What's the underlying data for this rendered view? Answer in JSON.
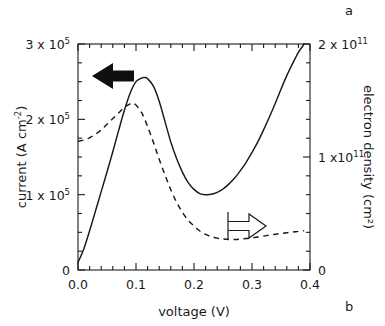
{
  "panels": {
    "top_right_label": "a",
    "bottom_right_label": "b"
  },
  "annotations": {
    "left_arrow_name": "arrow-to-left-axis",
    "right_arrow_name": "arrow-to-right-axis"
  },
  "chart_data": {
    "type": "line",
    "title": "",
    "xlabel": "voltage (V)",
    "ylabel": "current  (A cm²)",
    "ylabel_right": "electron  density  (cm²)",
    "xlim": [
      0.0,
      0.4
    ],
    "ylim_left": [
      0,
      300000
    ],
    "ylim_right": [
      0,
      200000000000
    ],
    "grid": false,
    "legend": "none",
    "x_ticks": [
      0.0,
      0.1,
      0.2,
      0.3,
      0.4
    ],
    "x_tick_labels": [
      "0.0",
      "0.1",
      "0.2",
      "0.3",
      "0.4"
    ],
    "x_minor_tick_step": 0.02,
    "y_left_ticks": [
      0,
      100000,
      200000,
      300000
    ],
    "y_left_tick_labels": [
      "0",
      "1 x 10",
      "2 x 10",
      "3 x 10"
    ],
    "y_left_tick_exponents": [
      "",
      "5",
      "5",
      "5"
    ],
    "y_left_minor_tick_step": 25000,
    "y_right_ticks": [
      0,
      100000000000,
      200000000000
    ],
    "y_right_tick_labels": [
      "0",
      "1 x10",
      "2 x 10"
    ],
    "y_right_tick_exponents": [
      "",
      "11",
      "11"
    ],
    "y_right_minor_tick_step": 16666666666,
    "series": [
      {
        "name": "current",
        "style": "solid",
        "axis": "left",
        "arrow": "left",
        "x": [
          0.0,
          0.01,
          0.02,
          0.03,
          0.04,
          0.05,
          0.06,
          0.07,
          0.08,
          0.09,
          0.1,
          0.11,
          0.115,
          0.12,
          0.13,
          0.14,
          0.15,
          0.16,
          0.17,
          0.18,
          0.19,
          0.2,
          0.21,
          0.22,
          0.23,
          0.24,
          0.25,
          0.26,
          0.27,
          0.28,
          0.29,
          0.3,
          0.31,
          0.32,
          0.33,
          0.34,
          0.35,
          0.36,
          0.37,
          0.38,
          0.39
        ],
        "y": [
          10000,
          28000,
          52000,
          78000,
          104000,
          130000,
          157000,
          185000,
          212000,
          235000,
          250000,
          255000,
          255500,
          254000,
          244000,
          224000,
          197000,
          170000,
          148000,
          130000,
          116000,
          107000,
          101500,
          100000,
          100500,
          103000,
          107500,
          114000,
          122000,
          132000,
          143000,
          156000,
          170000,
          186000,
          203000,
          221000,
          240000,
          258000,
          274000,
          289000,
          300000
        ]
      },
      {
        "name": "electron density",
        "style": "dashed",
        "axis": "right",
        "arrow": "right",
        "x": [
          0.0,
          0.01,
          0.02,
          0.03,
          0.04,
          0.05,
          0.06,
          0.07,
          0.08,
          0.09,
          0.095,
          0.1,
          0.11,
          0.12,
          0.13,
          0.14,
          0.15,
          0.16,
          0.17,
          0.18,
          0.19,
          0.2,
          0.21,
          0.22,
          0.23,
          0.24,
          0.25,
          0.26,
          0.27,
          0.28,
          0.29,
          0.3,
          0.31,
          0.32,
          0.33,
          0.34,
          0.35,
          0.36,
          0.37,
          0.38,
          0.39
        ],
        "y": [
          114000000000,
          115000000000,
          117000000000,
          120000000000,
          124000000000,
          129000000000,
          134000000000,
          139000000000,
          144000000000,
          147000000000,
          147500000000,
          146000000000,
          139000000000,
          127000000000,
          113000000000,
          98000000000,
          84000000000,
          71000000000,
          60000000000,
          51000000000,
          44000000000,
          39000000000,
          34500000000,
          31500000000,
          29500000000,
          28200000000,
          27400000000,
          27000000000,
          27000000000,
          27300000000,
          27800000000,
          28500000000,
          29200000000,
          30000000000,
          30800000000,
          31600000000,
          32300000000,
          33000000000,
          33600000000,
          34200000000,
          34800000000
        ]
      }
    ]
  }
}
